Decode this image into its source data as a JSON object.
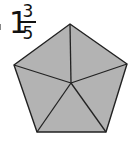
{
  "label": {
    "whole": "1",
    "numerator": "3",
    "denominator": "5"
  },
  "shape": {
    "type": "pentagon",
    "divided_into": 5,
    "fill": "#b3b3b3",
    "stroke": "#222222",
    "vertices": [
      [
        70,
        24
      ],
      [
        127,
        64
      ],
      [
        106,
        132
      ],
      [
        37,
        132
      ],
      [
        14,
        65
      ]
    ],
    "center": [
      71,
      83
    ]
  }
}
